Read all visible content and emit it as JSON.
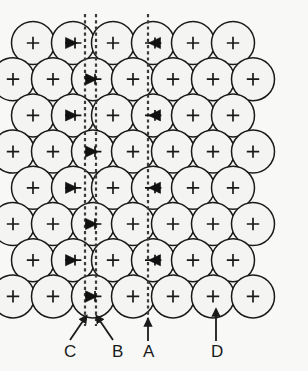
{
  "figure": {
    "background_color": "#f8f8f7",
    "line_color": "#1a1a1a",
    "circle_fill": "#f4f4f2",
    "dashed_line_color": "#3a3a3a",
    "width": 308,
    "height": 371
  },
  "lattice": {
    "description": "Close-packed rows of circles (atoms) in eight staggered rows",
    "rows": 8,
    "circles_odd_row": 6,
    "circles_even_row": 7,
    "radius": 21.5,
    "x_spacing": 40,
    "y_spacing": 36.2,
    "origin_x": 33,
    "origin_y": 43,
    "marker_types": {
      "plain": "plus-marker",
      "filled": "filled-wedge-plus-marker",
      "dashed": "dashed-cross-marker"
    }
  },
  "columns": {
    "A": {
      "label": "A",
      "line_x": 148,
      "kind": "single-dashed-line",
      "marker": "filled-wedge-plus-marker"
    },
    "B": {
      "label": "B",
      "line_x": 96,
      "kind": "single-dashed-line",
      "marker": "filled-wedge-plus-marker"
    },
    "C": {
      "label": "C",
      "line_x": 85,
      "kind": "single-dashed-line",
      "marker": "filled-wedge-plus-marker"
    },
    "D": {
      "label": "D",
      "line_x": 216,
      "kind": "no-line",
      "marker": "dashed-cross-marker"
    }
  },
  "annotations": {
    "labels": [
      {
        "id": "label-c",
        "text": "C",
        "x": 64,
        "y": 357,
        "arrow": "diagonal-up-right",
        "arrow_from": [
          70,
          340
        ],
        "arrow_to": [
          85,
          318
        ]
      },
      {
        "id": "label-b",
        "text": "B",
        "x": 112,
        "y": 357,
        "arrow": "diagonal-up-left",
        "arrow_from": [
          113,
          340
        ],
        "arrow_to": [
          98,
          318
        ]
      },
      {
        "id": "label-a",
        "text": "A",
        "x": 143,
        "y": 357,
        "arrow": "vertical-up",
        "arrow_from": [
          148,
          341
        ],
        "arrow_to": [
          148,
          322
        ]
      },
      {
        "id": "label-d",
        "text": "D",
        "x": 211,
        "y": 357,
        "arrow": "vertical-up",
        "arrow_from": [
          216,
          341
        ],
        "arrow_to": [
          216,
          312
        ]
      }
    ]
  }
}
